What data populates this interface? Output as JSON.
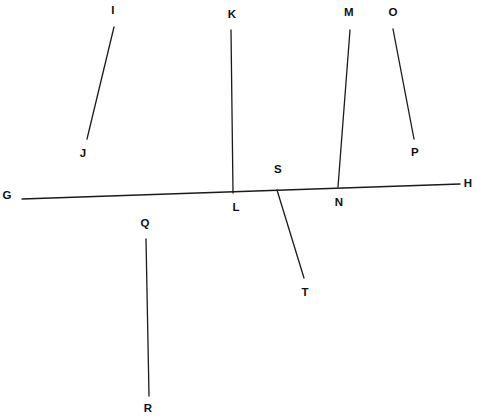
{
  "figure": {
    "type": "geometry-line-diagram",
    "width": 478,
    "height": 418,
    "background_color": "#ffffff",
    "stroke_color": "#1a1a1a",
    "stroke_width": 1.3,
    "label_color": "#111111"
  },
  "points": {
    "G": {
      "label": "G",
      "x": 7,
      "y": 196
    },
    "H": {
      "label": "H",
      "x": 468,
      "y": 184
    },
    "I": {
      "label": "I",
      "x": 113,
      "y": 11
    },
    "J": {
      "label": "J",
      "x": 83,
      "y": 154
    },
    "K": {
      "label": "K",
      "x": 232,
      "y": 15
    },
    "L": {
      "label": "L",
      "x": 236,
      "y": 208
    },
    "M": {
      "label": "M",
      "x": 349,
      "y": 13
    },
    "N": {
      "label": "N",
      "x": 339,
      "y": 203
    },
    "O": {
      "label": "O",
      "x": 393,
      "y": 13
    },
    "P": {
      "label": "P",
      "x": 415,
      "y": 153
    },
    "Q": {
      "label": "Q",
      "x": 145,
      "y": 224
    },
    "R": {
      "label": "R",
      "x": 148,
      "y": 409
    },
    "S": {
      "label": "S",
      "x": 278,
      "y": 170
    },
    "T": {
      "label": "T",
      "x": 305,
      "y": 293
    }
  },
  "segments": [
    {
      "name": "segment-GH",
      "from": "G",
      "to": "H",
      "x1": 22,
      "y1": 199,
      "x2": 460,
      "y2": 184
    },
    {
      "name": "segment-IJ",
      "from": "I",
      "to": "J",
      "x1": 114,
      "y1": 27,
      "x2": 87,
      "y2": 139
    },
    {
      "name": "segment-KL",
      "from": "K",
      "to": "L",
      "x1": 231,
      "y1": 30,
      "x2": 233,
      "y2": 193
    },
    {
      "name": "segment-MN",
      "from": "M",
      "to": "N",
      "x1": 350,
      "y1": 30,
      "x2": 338,
      "y2": 187
    },
    {
      "name": "segment-OP",
      "from": "O",
      "to": "P",
      "x1": 393,
      "y1": 29,
      "x2": 414,
      "y2": 139
    },
    {
      "name": "segment-QR",
      "from": "Q",
      "to": "R",
      "x1": 146,
      "y1": 239,
      "x2": 149,
      "y2": 396
    },
    {
      "name": "segment-ST",
      "from": "S",
      "to": "T",
      "x1": 277,
      "y1": 190,
      "x2": 304,
      "y2": 278
    }
  ]
}
